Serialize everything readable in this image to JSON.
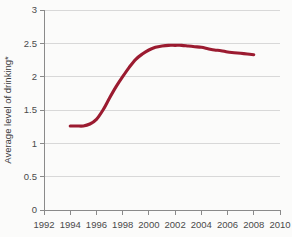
{
  "chart_data": {
    "type": "line",
    "title": "",
    "subtitle": "",
    "xlabel": "",
    "ylabel": "Average level of drinking*",
    "xlim": [
      1992,
      2010
    ],
    "ylim": [
      0,
      3
    ],
    "grid": true,
    "legend": false,
    "legend_position": "none",
    "line_color": "#9B1B30",
    "x_tick_labels": [
      "1992",
      "1994",
      "1996",
      "1998",
      "2000",
      "2002",
      "2004",
      "2006",
      "2008",
      "2010"
    ],
    "x_ticks": [
      1992,
      1994,
      1996,
      1998,
      2000,
      2002,
      2004,
      2006,
      2008,
      2010
    ],
    "y_tick_labels": [
      "0",
      "0.5",
      "1",
      "1.5",
      "2",
      "2.5",
      "3"
    ],
    "y_ticks": [
      0,
      0.5,
      1,
      1.5,
      2,
      2.5,
      3
    ],
    "series": [
      {
        "name": "Average level of drinking",
        "color": "#9B1B30",
        "x": [
          1994,
          1994.5,
          1995,
          1995.5,
          1996,
          1996.5,
          1997,
          1997.5,
          1998,
          1998.5,
          1999,
          1999.5,
          2000,
          2000.5,
          2001,
          2001.5,
          2002,
          2002.5,
          2003,
          2003.5,
          2004,
          2004.5,
          2005,
          2005.5,
          2006,
          2006.5,
          2007,
          2007.5,
          2008
        ],
        "values": [
          1.26,
          1.26,
          1.26,
          1.29,
          1.36,
          1.5,
          1.68,
          1.85,
          2.0,
          2.14,
          2.26,
          2.34,
          2.4,
          2.44,
          2.46,
          2.47,
          2.47,
          2.47,
          2.46,
          2.45,
          2.44,
          2.42,
          2.4,
          2.39,
          2.37,
          2.36,
          2.35,
          2.34,
          2.33
        ]
      }
    ],
    "annotations": []
  }
}
